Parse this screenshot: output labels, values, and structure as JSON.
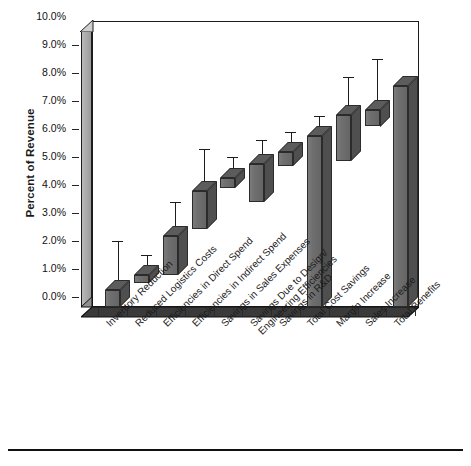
{
  "chart_data": {
    "type": "bar",
    "subtype": "floating-range-bar-3d-with-error-bars",
    "title": "",
    "xlabel": "",
    "ylabel": "Percent of Revenue",
    "ylim": [
      0.0,
      10.0
    ],
    "y_unit": "%",
    "grid": false,
    "legend": "none",
    "y_ticks": [
      "0.0%",
      "1.0%",
      "2.0%",
      "3.0%",
      "4.0%",
      "5.0%",
      "6.0%",
      "7.0%",
      "8.0%",
      "9.0%",
      "10.0%"
    ],
    "y_tick_values": [
      0.0,
      1.0,
      2.0,
      3.0,
      4.0,
      5.0,
      6.0,
      7.0,
      8.0,
      9.0,
      10.0
    ],
    "categories": [
      "Inventory Reduction",
      "Reduced Logistics Costs",
      "Efficiencies in Direct Spend",
      "Efficiencies in Indirect Spend",
      "Savings in Sales Expenses",
      "Savings Due to Design/\nEngineering Efficiencies",
      "Savings in R&D",
      "Total Cost Savings",
      "Margin Increase",
      "Sales Increase",
      "Total Benefits"
    ],
    "series": [
      {
        "name": "Range low (bar bottom)",
        "values": [
          0.0,
          0.85,
          1.15,
          2.8,
          4.25,
          3.75,
          5.05,
          0.0,
          5.2,
          6.45,
          0.0
        ]
      },
      {
        "name": "Range high (bar top)",
        "values": [
          0.6,
          1.15,
          2.55,
          4.15,
          4.6,
          5.1,
          5.55,
          6.1,
          6.85,
          7.05,
          7.9
        ]
      },
      {
        "name": "Upper whisker (error bar max)",
        "values": [
          2.0,
          1.5,
          3.4,
          5.3,
          5.0,
          5.6,
          5.9,
          6.45,
          7.85,
          8.5,
          null
        ]
      }
    ],
    "bar_color": "#6b6b6b",
    "bar_outline_color": "#2b2b2b",
    "wall_color": "#a9a9a9",
    "axis_color": "#1c1c1c"
  },
  "axis": {
    "y_title": "Percent of Revenue"
  }
}
